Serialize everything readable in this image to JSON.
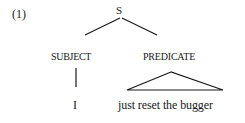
{
  "example_number": "(1)",
  "tree": {
    "root": {
      "label": "S"
    },
    "children": [
      {
        "label": "SUBJECT",
        "connector": "line",
        "leaf": "I"
      },
      {
        "label": "PREDICATE",
        "connector": "triangle",
        "leaf": "just reset the bugger"
      }
    ]
  },
  "colors": {
    "ink": "#1a1a1a",
    "background": "#ffffff"
  }
}
